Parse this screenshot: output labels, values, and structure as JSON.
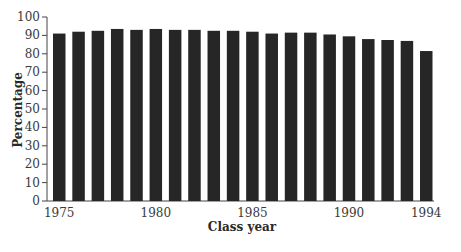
{
  "chart_data": {
    "type": "bar",
    "title": "",
    "xlabel": "Class year",
    "ylabel": "Percentage",
    "ylim": [
      0,
      100
    ],
    "yticks": [
      0,
      10,
      20,
      30,
      40,
      50,
      60,
      70,
      80,
      90,
      100
    ],
    "xtick_labels": [
      "1975",
      "1980",
      "1985",
      "1990",
      "1994"
    ],
    "categories": [
      "1975",
      "1976",
      "1977",
      "1978",
      "1979",
      "1980",
      "1981",
      "1982",
      "1983",
      "1984",
      "1985",
      "1986",
      "1987",
      "1988",
      "1989",
      "1990",
      "1991",
      "1992",
      "1993",
      "1994"
    ],
    "values": [
      91,
      92,
      92.5,
      93.5,
      93,
      93.5,
      93,
      93,
      92.5,
      92.5,
      92,
      91,
      91.5,
      91.5,
      90.5,
      89.5,
      88,
      87.5,
      87,
      81.5
    ],
    "grid": false,
    "legend": null,
    "bar_color": "#262626"
  }
}
